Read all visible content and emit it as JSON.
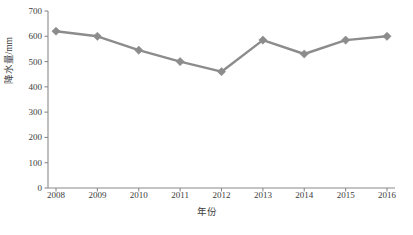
{
  "chart_data": {
    "type": "line",
    "title": "",
    "xlabel": "年份",
    "ylabel": "降水量/mm",
    "categories": [
      "2008",
      "2009",
      "2010",
      "2011",
      "2012",
      "2013",
      "2014",
      "2015",
      "2016"
    ],
    "values": [
      620,
      600,
      545,
      500,
      460,
      585,
      530,
      585,
      600
    ],
    "series": [
      {
        "name": "降水量",
        "values": [
          620,
          600,
          545,
          500,
          460,
          585,
          530,
          585,
          600
        ]
      }
    ],
    "ylim": [
      0,
      700
    ],
    "yticks": [
      0,
      100,
      200,
      300,
      400,
      500,
      600,
      700
    ],
    "ytick_labels": [
      "0",
      "100",
      "200",
      "300",
      "400",
      "500",
      "600",
      "700"
    ],
    "grid": false,
    "legend": false,
    "legend_position": "none",
    "marker": "diamond",
    "line_color": "#8c8c8c",
    "marker_color": "#8c8c8c",
    "axis_color": "#8a8a8a",
    "text_color": "#3c3c3c"
  }
}
